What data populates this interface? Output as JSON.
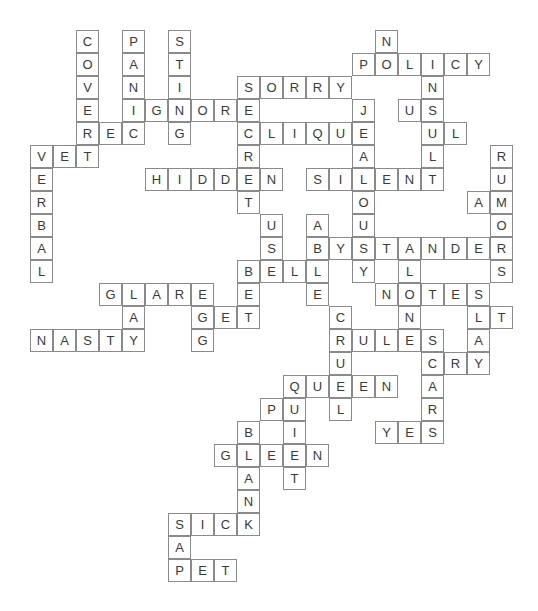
{
  "puzzle": {
    "type": "crossword",
    "cells": [
      {
        "r": 0,
        "c": 2,
        "ch": "C"
      },
      {
        "r": 1,
        "c": 2,
        "ch": "O"
      },
      {
        "r": 2,
        "c": 2,
        "ch": "V"
      },
      {
        "r": 3,
        "c": 2,
        "ch": "E"
      },
      {
        "r": 4,
        "c": 2,
        "ch": "R"
      },
      {
        "r": 5,
        "c": 2,
        "ch": "T"
      },
      {
        "r": 0,
        "c": 4,
        "ch": "P"
      },
      {
        "r": 1,
        "c": 4,
        "ch": "A"
      },
      {
        "r": 2,
        "c": 4,
        "ch": "N"
      },
      {
        "r": 3,
        "c": 4,
        "ch": "I"
      },
      {
        "r": 4,
        "c": 4,
        "ch": "C"
      },
      {
        "r": 0,
        "c": 6,
        "ch": "S"
      },
      {
        "r": 1,
        "c": 6,
        "ch": "T"
      },
      {
        "r": 2,
        "c": 6,
        "ch": "I"
      },
      {
        "r": 3,
        "c": 6,
        "ch": "N"
      },
      {
        "r": 4,
        "c": 6,
        "ch": "G"
      },
      {
        "r": 0,
        "c": 15,
        "ch": "N"
      },
      {
        "r": 1,
        "c": 14,
        "ch": "P"
      },
      {
        "r": 1,
        "c": 15,
        "ch": "O"
      },
      {
        "r": 1,
        "c": 16,
        "ch": "L"
      },
      {
        "r": 1,
        "c": 17,
        "ch": "I"
      },
      {
        "r": 1,
        "c": 18,
        "ch": "C"
      },
      {
        "r": 1,
        "c": 19,
        "ch": "Y"
      },
      {
        "r": 2,
        "c": 9,
        "ch": "S"
      },
      {
        "r": 2,
        "c": 10,
        "ch": "O"
      },
      {
        "r": 2,
        "c": 11,
        "ch": "R"
      },
      {
        "r": 2,
        "c": 12,
        "ch": "R"
      },
      {
        "r": 2,
        "c": 13,
        "ch": "Y"
      },
      {
        "r": 2,
        "c": 17,
        "ch": "N"
      },
      {
        "r": 3,
        "c": 5,
        "ch": "G"
      },
      {
        "r": 3,
        "c": 7,
        "ch": "O"
      },
      {
        "r": 3,
        "c": 8,
        "ch": "R"
      },
      {
        "r": 3,
        "c": 9,
        "ch": "E"
      },
      {
        "r": 3,
        "c": 14,
        "ch": "J"
      },
      {
        "r": 3,
        "c": 16,
        "ch": "U"
      },
      {
        "r": 3,
        "c": 17,
        "ch": "S"
      },
      {
        "r": 4,
        "c": 3,
        "ch": "E"
      },
      {
        "r": 4,
        "c": 9,
        "ch": "C"
      },
      {
        "r": 4,
        "c": 10,
        "ch": "L"
      },
      {
        "r": 4,
        "c": 11,
        "ch": "I"
      },
      {
        "r": 4,
        "c": 12,
        "ch": "Q"
      },
      {
        "r": 4,
        "c": 13,
        "ch": "U"
      },
      {
        "r": 4,
        "c": 14,
        "ch": "E"
      },
      {
        "r": 4,
        "c": 17,
        "ch": "U"
      },
      {
        "r": 4,
        "c": 18,
        "ch": "L"
      },
      {
        "r": 5,
        "c": 0,
        "ch": "V"
      },
      {
        "r": 5,
        "c": 1,
        "ch": "E"
      },
      {
        "r": 5,
        "c": 9,
        "ch": "R"
      },
      {
        "r": 5,
        "c": 14,
        "ch": "A"
      },
      {
        "r": 5,
        "c": 17,
        "ch": "L"
      },
      {
        "r": 5,
        "c": 20,
        "ch": "R"
      },
      {
        "r": 6,
        "c": 0,
        "ch": "E"
      },
      {
        "r": 6,
        "c": 5,
        "ch": "H"
      },
      {
        "r": 6,
        "c": 6,
        "ch": "I"
      },
      {
        "r": 6,
        "c": 7,
        "ch": "D"
      },
      {
        "r": 6,
        "c": 8,
        "ch": "D"
      },
      {
        "r": 6,
        "c": 9,
        "ch": "E"
      },
      {
        "r": 6,
        "c": 10,
        "ch": "N"
      },
      {
        "r": 6,
        "c": 12,
        "ch": "S"
      },
      {
        "r": 6,
        "c": 13,
        "ch": "I"
      },
      {
        "r": 6,
        "c": 14,
        "ch": "L"
      },
      {
        "r": 6,
        "c": 15,
        "ch": "E"
      },
      {
        "r": 6,
        "c": 16,
        "ch": "N"
      },
      {
        "r": 6,
        "c": 17,
        "ch": "T"
      },
      {
        "r": 6,
        "c": 20,
        "ch": "U"
      },
      {
        "r": 7,
        "c": 0,
        "ch": "R"
      },
      {
        "r": 7,
        "c": 9,
        "ch": "T"
      },
      {
        "r": 7,
        "c": 14,
        "ch": "O"
      },
      {
        "r": 7,
        "c": 19,
        "ch": "A"
      },
      {
        "r": 7,
        "c": 20,
        "ch": "M"
      },
      {
        "r": 8,
        "c": 0,
        "ch": "B"
      },
      {
        "r": 8,
        "c": 10,
        "ch": "U"
      },
      {
        "r": 8,
        "c": 12,
        "ch": "A"
      },
      {
        "r": 8,
        "c": 14,
        "ch": "U"
      },
      {
        "r": 8,
        "c": 20,
        "ch": "O"
      },
      {
        "r": 9,
        "c": 0,
        "ch": "A"
      },
      {
        "r": 9,
        "c": 10,
        "ch": "S"
      },
      {
        "r": 9,
        "c": 12,
        "ch": "B"
      },
      {
        "r": 9,
        "c": 13,
        "ch": "Y"
      },
      {
        "r": 9,
        "c": 14,
        "ch": "S"
      },
      {
        "r": 9,
        "c": 15,
        "ch": "T"
      },
      {
        "r": 9,
        "c": 16,
        "ch": "A"
      },
      {
        "r": 9,
        "c": 17,
        "ch": "N"
      },
      {
        "r": 9,
        "c": 18,
        "ch": "D"
      },
      {
        "r": 9,
        "c": 19,
        "ch": "E"
      },
      {
        "r": 9,
        "c": 20,
        "ch": "R"
      },
      {
        "r": 10,
        "c": 0,
        "ch": "L"
      },
      {
        "r": 10,
        "c": 9,
        "ch": "B"
      },
      {
        "r": 10,
        "c": 10,
        "ch": "E"
      },
      {
        "r": 10,
        "c": 11,
        "ch": "L"
      },
      {
        "r": 10,
        "c": 12,
        "ch": "L"
      },
      {
        "r": 10,
        "c": 14,
        "ch": "Y"
      },
      {
        "r": 10,
        "c": 16,
        "ch": "L"
      },
      {
        "r": 10,
        "c": 20,
        "ch": "S"
      },
      {
        "r": 11,
        "c": 3,
        "ch": "G"
      },
      {
        "r": 11,
        "c": 4,
        "ch": "L"
      },
      {
        "r": 11,
        "c": 5,
        "ch": "A"
      },
      {
        "r": 11,
        "c": 6,
        "ch": "R"
      },
      {
        "r": 11,
        "c": 7,
        "ch": "E"
      },
      {
        "r": 11,
        "c": 9,
        "ch": "E"
      },
      {
        "r": 11,
        "c": 12,
        "ch": "E"
      },
      {
        "r": 11,
        "c": 15,
        "ch": "N"
      },
      {
        "r": 11,
        "c": 16,
        "ch": "O"
      },
      {
        "r": 11,
        "c": 17,
        "ch": "T"
      },
      {
        "r": 11,
        "c": 18,
        "ch": "E"
      },
      {
        "r": 11,
        "c": 19,
        "ch": "S"
      },
      {
        "r": 12,
        "c": 4,
        "ch": "A"
      },
      {
        "r": 12,
        "c": 7,
        "ch": "G"
      },
      {
        "r": 12,
        "c": 8,
        "ch": "E"
      },
      {
        "r": 12,
        "c": 9,
        "ch": "T"
      },
      {
        "r": 12,
        "c": 13,
        "ch": "C"
      },
      {
        "r": 12,
        "c": 16,
        "ch": "N"
      },
      {
        "r": 12,
        "c": 19,
        "ch": "L"
      },
      {
        "r": 12,
        "c": 20,
        "ch": "T"
      },
      {
        "r": 13,
        "c": 0,
        "ch": "N"
      },
      {
        "r": 13,
        "c": 1,
        "ch": "A"
      },
      {
        "r": 13,
        "c": 2,
        "ch": "S"
      },
      {
        "r": 13,
        "c": 3,
        "ch": "T"
      },
      {
        "r": 13,
        "c": 4,
        "ch": "Y"
      },
      {
        "r": 13,
        "c": 7,
        "ch": "G"
      },
      {
        "r": 13,
        "c": 13,
        "ch": "R"
      },
      {
        "r": 13,
        "c": 14,
        "ch": "U"
      },
      {
        "r": 13,
        "c": 15,
        "ch": "L"
      },
      {
        "r": 13,
        "c": 16,
        "ch": "E"
      },
      {
        "r": 13,
        "c": 17,
        "ch": "S"
      },
      {
        "r": 13,
        "c": 19,
        "ch": "A"
      },
      {
        "r": 14,
        "c": 13,
        "ch": "U"
      },
      {
        "r": 14,
        "c": 17,
        "ch": "C"
      },
      {
        "r": 14,
        "c": 18,
        "ch": "R"
      },
      {
        "r": 14,
        "c": 19,
        "ch": "Y"
      },
      {
        "r": 15,
        "c": 11,
        "ch": "Q"
      },
      {
        "r": 15,
        "c": 12,
        "ch": "U"
      },
      {
        "r": 15,
        "c": 13,
        "ch": "E"
      },
      {
        "r": 15,
        "c": 14,
        "ch": "E"
      },
      {
        "r": 15,
        "c": 15,
        "ch": "N"
      },
      {
        "r": 15,
        "c": 17,
        "ch": "A"
      },
      {
        "r": 16,
        "c": 10,
        "ch": "P"
      },
      {
        "r": 16,
        "c": 11,
        "ch": "U"
      },
      {
        "r": 16,
        "c": 13,
        "ch": "L"
      },
      {
        "r": 16,
        "c": 17,
        "ch": "R"
      },
      {
        "r": 17,
        "c": 9,
        "ch": "B"
      },
      {
        "r": 17,
        "c": 11,
        "ch": "I"
      },
      {
        "r": 17,
        "c": 15,
        "ch": "Y"
      },
      {
        "r": 17,
        "c": 16,
        "ch": "E"
      },
      {
        "r": 17,
        "c": 17,
        "ch": "S"
      },
      {
        "r": 18,
        "c": 8,
        "ch": "G"
      },
      {
        "r": 18,
        "c": 9,
        "ch": "L"
      },
      {
        "r": 18,
        "c": 10,
        "ch": "E"
      },
      {
        "r": 18,
        "c": 11,
        "ch": "E"
      },
      {
        "r": 18,
        "c": 12,
        "ch": "N"
      },
      {
        "r": 19,
        "c": 9,
        "ch": "A"
      },
      {
        "r": 19,
        "c": 11,
        "ch": "T"
      },
      {
        "r": 20,
        "c": 9,
        "ch": "N"
      },
      {
        "r": 21,
        "c": 6,
        "ch": "S"
      },
      {
        "r": 21,
        "c": 7,
        "ch": "I"
      },
      {
        "r": 21,
        "c": 8,
        "ch": "C"
      },
      {
        "r": 21,
        "c": 9,
        "ch": "K"
      },
      {
        "r": 22,
        "c": 6,
        "ch": "A"
      },
      {
        "r": 23,
        "c": 6,
        "ch": "P"
      },
      {
        "r": 23,
        "c": 7,
        "ch": "E"
      },
      {
        "r": 23,
        "c": 8,
        "ch": "T"
      }
    ]
  }
}
